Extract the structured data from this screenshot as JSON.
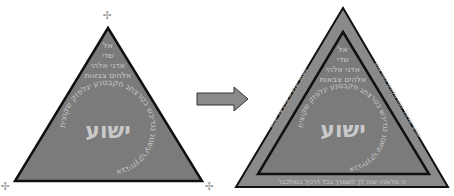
{
  "colors": {
    "triangle_fill": "#7b7b7b",
    "triangle_border": "#111111",
    "text_light": "#cdcdcd",
    "arrow_fill": "#8a8a8a",
    "arrow_border": "#333333",
    "mark": "#9a9a9a"
  },
  "left_triangle": {
    "center_name": "ישוע",
    "lines": [
      "אל",
      "שדי",
      "אדני אלהי",
      "אלהים צבאות"
    ],
    "circle_text": "אבגיתץקרעשטנ נגדיכש בטרצתג חקבטנע יגלפזק שקוצית",
    "corner_marks": [
      "✢",
      "✢",
      "✢"
    ]
  },
  "arrow": {
    "icon": "right-arrow"
  },
  "right_triangle": {
    "center_name": "ישוע",
    "lines": [
      "אל",
      "שדי",
      "אדני אלהי",
      "אלהים צבאות"
    ],
    "circle_text": "אבגיתץקרעשטנ נגדיכש בטרצתג חקבטנע יגלפזק שקוצית",
    "border_text_bottom": "כי מלאכיו יצוה לך לשמרך בכל דרכיך כמולכבר",
    "border_text_left": "ויאמר אליו ייי אליו אל יאמר",
    "border_text_right": "שמע ישראל יהוה אלהינו יהוה אחד"
  }
}
